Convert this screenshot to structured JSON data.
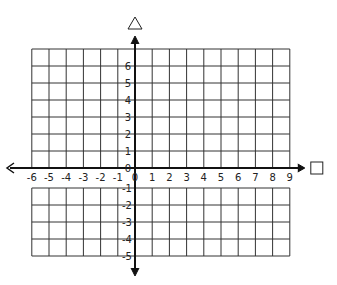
{
  "diagram": {
    "type": "coordinate-grid",
    "x_axis": {
      "symbol": "□",
      "labels": [
        "-6",
        "-5",
        "-4",
        "-3",
        "-2",
        "-1",
        "0",
        "1",
        "2",
        "3",
        "4",
        "5",
        "6",
        "7",
        "8",
        "9"
      ],
      "range": [
        -6,
        9
      ]
    },
    "y_axis": {
      "symbol": "△",
      "labels_positive": [
        "6",
        "5",
        "4",
        "3",
        "2",
        "1",
        "0"
      ],
      "labels_negative": [
        "-1",
        "-2",
        "-3",
        "-4",
        "-5"
      ],
      "range": [
        -5,
        6
      ]
    },
    "colors": {
      "line": "#222222",
      "grid": "#333333",
      "background": "#ffffff"
    }
  }
}
